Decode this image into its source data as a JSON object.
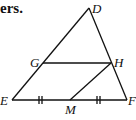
{
  "heading_fragment": "ers.",
  "figure": {
    "points": {
      "D": "D",
      "E": "E",
      "F": "F",
      "G": "G",
      "H": "H",
      "M": "M"
    },
    "segments": [
      "DE",
      "DF",
      "EF",
      "GH",
      "HM"
    ],
    "congruence_marks": {
      "EM": "||",
      "MF": "||"
    },
    "line_color": "#111111"
  }
}
